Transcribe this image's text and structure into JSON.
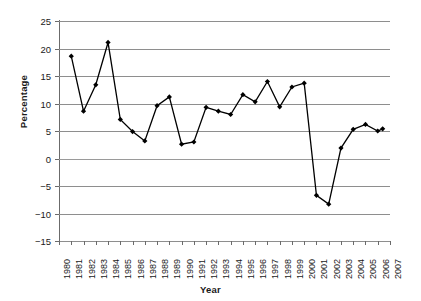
{
  "chart_data": {
    "type": "line",
    "title": "",
    "xlabel": "Year",
    "ylabel": "Percentage",
    "x": [
      1981,
      1982,
      1983,
      1984,
      1985,
      1986,
      1987,
      1988,
      1989,
      1990,
      1991,
      1992,
      1993,
      1994,
      1995,
      1996,
      1997,
      1998,
      1999,
      2000,
      2001,
      2002,
      2003,
      2004,
      2005,
      2006
    ],
    "values": [
      18.6,
      8.6,
      13.4,
      21.1,
      7.1,
      4.9,
      3.2,
      9.6,
      11.2,
      2.6,
      3.0,
      9.3,
      8.6,
      8.0,
      11.6,
      10.3,
      14.0,
      9.4,
      13.0,
      13.7,
      -6.7,
      -8.3,
      1.9,
      5.3,
      6.2,
      5.0
    ],
    "last_point": {
      "x": 2006.4,
      "y": 5.4
    },
    "xlim": [
      1980,
      2007
    ],
    "ylim": [
      -15,
      25
    ],
    "ytick_labels": [
      "25",
      "20",
      "15",
      "10",
      "5",
      "0",
      "−5",
      "−10",
      "−15"
    ],
    "ytick_values": [
      25,
      20,
      15,
      10,
      5,
      0,
      -5,
      -10,
      -15
    ],
    "xtick_labels": [
      "1980",
      "1981",
      "1982",
      "1983",
      "1984",
      "1985",
      "1986",
      "1987",
      "1988",
      "1989",
      "1990",
      "1991",
      "1992",
      "1993",
      "1994",
      "1995",
      "1996",
      "1997",
      "1998",
      "1999",
      "2000",
      "2001",
      "2002",
      "2003",
      "2004",
      "2005",
      "2006",
      "2007"
    ],
    "grid": "horizontal",
    "legend": "none",
    "marker": "diamond",
    "line_color": "#000000",
    "grid_color": "#8e8e8e"
  }
}
